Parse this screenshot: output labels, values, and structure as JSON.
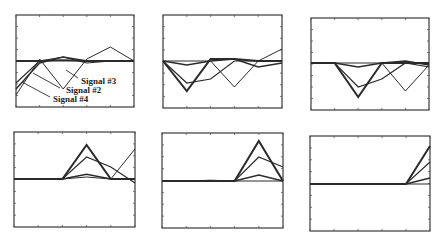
{
  "chart_data": [
    {
      "type": "line",
      "panel": 1,
      "x": [
        0,
        1,
        2,
        3,
        4,
        5
      ],
      "ylim": [
        -1,
        1
      ],
      "series": [
        {
          "name": "Signal #1",
          "values": [
            0.0,
            0.0,
            0.02,
            0.0,
            0.0,
            0.0
          ],
          "width": 2.0
        },
        {
          "name": "Signal #2",
          "values": [
            -0.55,
            0.0,
            0.1,
            -0.05,
            0.0,
            0.0
          ],
          "width": 1.2
        },
        {
          "name": "Signal #3",
          "values": [
            -0.85,
            0.05,
            -0.7,
            0.05,
            0.35,
            0.0
          ],
          "width": 1.0
        },
        {
          "name": "Signal #4",
          "values": [
            -0.7,
            -0.05,
            0.1,
            0.0,
            0.0,
            0.0
          ],
          "width": 1.4
        }
      ],
      "annotations": [
        {
          "text": "Signal #3",
          "x": 3.0,
          "y": -0.62
        },
        {
          "text": "Signal #2",
          "x": 2.3,
          "y": -0.82
        },
        {
          "text": "Signal #4",
          "x": 1.6,
          "y": -1.0
        }
      ]
    },
    {
      "type": "line",
      "panel": 2,
      "x": [
        0,
        1,
        2,
        3,
        4,
        5
      ],
      "ylim": [
        -1,
        1
      ],
      "series": [
        {
          "name": "Signal #1",
          "values": [
            0.0,
            -0.75,
            0.05,
            0.05,
            0.0,
            0.0
          ],
          "width": 2.0
        },
        {
          "name": "Signal #2",
          "values": [
            0.0,
            -0.55,
            -0.45,
            0.0,
            0.0,
            0.0
          ],
          "width": 1.2
        },
        {
          "name": "Signal #3",
          "values": [
            0.0,
            0.0,
            0.0,
            -0.65,
            0.0,
            0.3
          ],
          "width": 1.0
        },
        {
          "name": "Signal #4",
          "values": [
            0.0,
            -0.1,
            0.0,
            0.05,
            -0.15,
            -0.05
          ],
          "width": 1.4
        }
      ]
    },
    {
      "type": "line",
      "panel": 3,
      "x": [
        0,
        1,
        2,
        3,
        4,
        5
      ],
      "ylim": [
        -1,
        1
      ],
      "series": [
        {
          "name": "Signal #1",
          "values": [
            0.0,
            0.0,
            -0.85,
            0.0,
            0.0,
            0.0
          ],
          "width": 2.0
        },
        {
          "name": "Signal #2",
          "values": [
            0.0,
            0.0,
            -0.6,
            -0.4,
            0.0,
            -0.1
          ],
          "width": 1.2
        },
        {
          "name": "Signal #3",
          "values": [
            0.0,
            0.0,
            0.0,
            0.0,
            -0.7,
            -0.05
          ],
          "width": 1.0
        },
        {
          "name": "Signal #4",
          "values": [
            0.0,
            0.0,
            -0.1,
            0.0,
            0.05,
            -0.05
          ],
          "width": 1.4
        }
      ]
    },
    {
      "type": "line",
      "panel": 4,
      "x": [
        0,
        1,
        2,
        3,
        4,
        5
      ],
      "ylim": [
        -1,
        1
      ],
      "series": [
        {
          "name": "Signal #1",
          "values": [
            0.0,
            0.0,
            0.0,
            0.85,
            0.0,
            0.0
          ],
          "width": 2.0
        },
        {
          "name": "Signal #2",
          "values": [
            0.0,
            0.0,
            0.0,
            0.55,
            0.3,
            -0.1
          ],
          "width": 1.2
        },
        {
          "name": "Signal #3",
          "values": [
            0.0,
            0.0,
            0.0,
            0.05,
            0.0,
            0.75
          ],
          "width": 1.0
        },
        {
          "name": "Signal #4",
          "values": [
            0.0,
            0.0,
            0.0,
            0.12,
            0.0,
            0.0
          ],
          "width": 1.4
        }
      ]
    },
    {
      "type": "line",
      "panel": 5,
      "x": [
        0,
        1,
        2,
        3,
        4,
        5
      ],
      "ylim": [
        -1,
        1
      ],
      "series": [
        {
          "name": "Signal #1",
          "values": [
            0.0,
            0.0,
            0.0,
            0.0,
            1.0,
            0.0
          ],
          "width": 2.0
        },
        {
          "name": "Signal #2",
          "values": [
            0.0,
            0.0,
            0.0,
            0.0,
            0.6,
            0.35
          ],
          "width": 1.2
        },
        {
          "name": "Signal #3",
          "values": [
            0.0,
            0.0,
            0.02,
            0.0,
            0.0,
            0.0
          ],
          "width": 1.0
        },
        {
          "name": "Signal #4",
          "values": [
            0.0,
            0.0,
            0.0,
            0.0,
            0.15,
            0.0
          ],
          "width": 1.4
        }
      ]
    },
    {
      "type": "line",
      "panel": 6,
      "x": [
        0,
        1,
        2,
        3,
        4,
        5
      ],
      "ylim": [
        -1,
        1
      ],
      "series": [
        {
          "name": "Signal #1",
          "values": [
            0.0,
            0.0,
            0.0,
            0.0,
            0.0,
            0.95
          ],
          "width": 2.0
        },
        {
          "name": "Signal #2",
          "values": [
            0.0,
            0.0,
            0.0,
            0.0,
            0.0,
            0.55
          ],
          "width": 1.2
        },
        {
          "name": "Signal #3",
          "values": [
            0.0,
            0.0,
            0.0,
            0.0,
            0.0,
            0.0
          ],
          "width": 1.0
        },
        {
          "name": "Signal #4",
          "values": [
            0.0,
            0.0,
            0.0,
            0.0,
            0.0,
            0.15
          ],
          "width": 1.4
        }
      ]
    }
  ],
  "layout": {
    "panels": [
      {
        "x0": 16,
        "y0": 15,
        "x1": 134,
        "y1": 107,
        "base": 61
      },
      {
        "x0": 163,
        "y0": 15,
        "x1": 282,
        "y1": 108,
        "base": 61
      },
      {
        "x0": 311,
        "y0": 18,
        "x1": 429,
        "y1": 110,
        "base": 63
      },
      {
        "x0": 14,
        "y0": 132,
        "x1": 135,
        "y1": 227,
        "base": 179
      },
      {
        "x0": 162,
        "y0": 133,
        "x1": 283,
        "y1": 228,
        "base": 181
      },
      {
        "x0": 310,
        "y0": 136,
        "x1": 430,
        "y1": 231,
        "base": 184
      }
    ],
    "line_color": "#2b2b2b",
    "amp": 40
  },
  "labels": {
    "signal3": "Signal #3",
    "signal2": "Signal #2",
    "signal4": "Signal #4"
  }
}
